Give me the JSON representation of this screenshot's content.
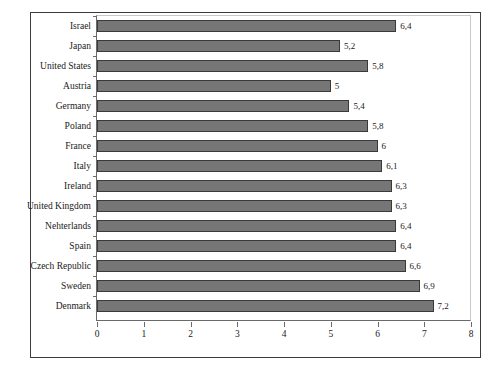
{
  "chart_data": {
    "type": "bar",
    "orientation": "horizontal",
    "title": "",
    "subtitle": "",
    "xlabel": "",
    "ylabel": "",
    "xlim": [
      0,
      8
    ],
    "xticks": [
      "0",
      "1",
      "2",
      "3",
      "4",
      "5",
      "6",
      "7",
      "8"
    ],
    "grid": false,
    "legend": "none",
    "decimal_separator": ",",
    "categories": [
      "Israel",
      "Japan",
      "United States",
      "Austria",
      "Germany",
      "Poland",
      "France",
      "Italy",
      "Ireland",
      "United Kingdom",
      "Nehterlands",
      "Spain",
      "Czech Republic",
      "Sweden",
      "Denmark"
    ],
    "values": [
      6.4,
      5.2,
      5.8,
      5,
      5.4,
      5.8,
      6,
      6.1,
      6.3,
      6.3,
      6.4,
      6.4,
      6.6,
      6.9,
      7.2
    ],
    "value_labels": [
      "6,4",
      "5,2",
      "5,8",
      "5",
      "5,4",
      "5,8",
      "6",
      "6,1",
      "6,3",
      "6,3",
      "6,4",
      "6,4",
      "6,6",
      "6,9",
      "7,2"
    ],
    "colors": {
      "bar_fill": "#767676",
      "bar_border": "#3a3a3a",
      "frame": "#3c3c3c",
      "axis": "#6a6a6a",
      "plot_background": "#ffffff",
      "text": "#1a1a1a"
    }
  }
}
